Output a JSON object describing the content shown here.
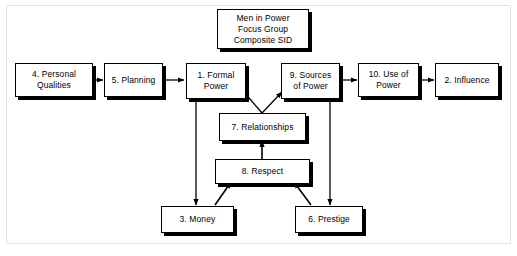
{
  "diagram": {
    "title_box": {
      "lines": [
        "Men in Power",
        "Focus Group",
        "Composite SID"
      ]
    },
    "nodes": [
      {
        "id": "header",
        "label": "Men in Power\nFocus Group\nComposite SID",
        "line1": "Men in Power",
        "line2": "Focus Group",
        "line3": "Composite SID"
      },
      {
        "id": "personal",
        "line1": "4. Personal",
        "line2": "Qualities"
      },
      {
        "id": "planning",
        "line1": "5. Planning",
        "line2": ""
      },
      {
        "id": "formal",
        "line1": "1. Formal",
        "line2": "Power"
      },
      {
        "id": "sources",
        "line1": "9. Sources",
        "line2": "of Power"
      },
      {
        "id": "use",
        "line1": "10. Use of",
        "line2": "Power"
      },
      {
        "id": "influence",
        "line1": "2. Influence",
        "line2": ""
      },
      {
        "id": "relationships",
        "line1": "7. Relationships",
        "line2": ""
      },
      {
        "id": "respect",
        "line1": "8. Respect",
        "line2": ""
      },
      {
        "id": "money",
        "line1": "3. Money",
        "line2": ""
      },
      {
        "id": "prestige",
        "line1": "6. Prestige",
        "line2": ""
      }
    ],
    "edges": [
      {
        "from": "4. Personal Qualities",
        "to": "5. Planning"
      },
      {
        "from": "5. Planning",
        "to": "1. Formal Power"
      },
      {
        "from": "9. Sources of Power",
        "to": "10. Use of Power"
      },
      {
        "from": "10. Use of Power",
        "to": "2. Influence"
      },
      {
        "from": "1. Formal Power",
        "to": "3. Money"
      },
      {
        "from": "9. Sources of Power",
        "to": "6. Prestige"
      },
      {
        "from": "3. Money",
        "to": "8. Respect"
      },
      {
        "from": "6. Prestige",
        "to": "8. Respect"
      },
      {
        "from": "8. Respect",
        "to": "7. Relationships"
      },
      {
        "from": "7. Relationships",
        "to": "1. Formal Power"
      },
      {
        "from": "7. Relationships",
        "to": "9. Sources of Power"
      }
    ],
    "colors": {
      "background": "#ffffff",
      "box_fill": "#ffffff",
      "stroke": "#000000",
      "shadow": "#000000",
      "frame": "#e2e2e2"
    }
  }
}
